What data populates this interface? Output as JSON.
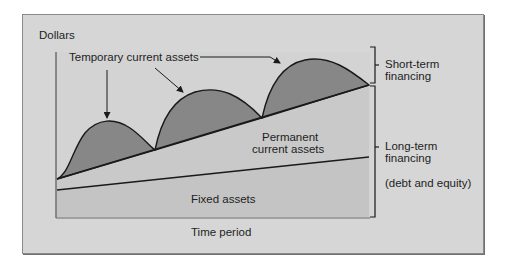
{
  "diagram": {
    "y_axis_label": "Dollars",
    "x_axis_label": "Time period",
    "annotations": {
      "temporary_current_assets": "Temporary current assets",
      "permanent_current_assets_line1": "Permanent",
      "permanent_current_assets_line2": "current assets",
      "fixed_assets": "Fixed assets"
    },
    "brackets": {
      "short_term_line1": "Short-term",
      "short_term_line2": "financing",
      "long_term_line1": "Long-term",
      "long_term_line2": "financing",
      "long_term_note": "(debt and equity)"
    },
    "colors": {
      "background": "#d6d6d6",
      "plot_area": "#c9c9c9",
      "permanent_region": "#c6c6c6",
      "temporary_hump": "#8a8a8a",
      "line": "#1a1a1a"
    }
  }
}
